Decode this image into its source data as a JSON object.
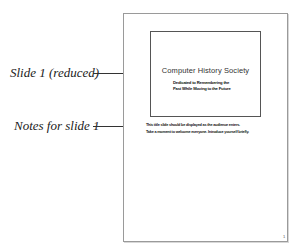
{
  "callouts": {
    "slide_label": "Slide 1 (reduced)",
    "notes_label": "Notes for slide 1"
  },
  "slide": {
    "title": "Computer History Society",
    "subtitle_lines": [
      "Dedicated to Remembering the",
      "Past While Moving to the Future"
    ]
  },
  "notes": {
    "lines": [
      "This title slide should be displayed as the audience enters.",
      "Take a moment to welcome everyone. Introduce yourself briefly."
    ]
  },
  "page": {
    "number": "1"
  },
  "colors": {
    "page_border": "#9a9a9a",
    "slide_border": "#555555",
    "leader_line": "#333333",
    "text": "#222222"
  }
}
